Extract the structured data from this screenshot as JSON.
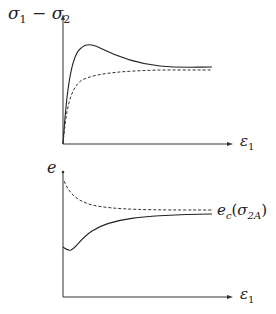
{
  "top_plot": {
    "y_label": "σ₁ − σ₂",
    "x_label": "ε₁",
    "curves": [
      {
        "name": "solid-curve",
        "style": "solid",
        "shape": "rises to peak then softens to plateau"
      },
      {
        "name": "dashed-curve",
        "style": "dashed",
        "shape": "monotonic rise to plateau"
      }
    ]
  },
  "bottom_plot": {
    "y_label": "e",
    "x_label": "ε₁",
    "curve_label": "e",
    "curve_label_sub": "c",
    "curve_label_arg": "(σ",
    "curve_label_arg_sub": "2A",
    "curve_label_close": ")",
    "curves": [
      {
        "name": "dashed-curve",
        "style": "dashed",
        "shape": "decreasing to critical void ratio"
      },
      {
        "name": "solid-curve",
        "style": "solid",
        "shape": "slight dip then increasing to critical void ratio"
      }
    ]
  }
}
